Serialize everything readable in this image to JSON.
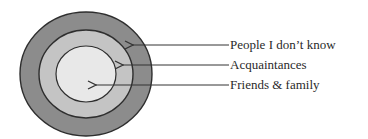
{
  "diagram": {
    "type": "concentric-circles",
    "colors": {
      "outer_ring": "#8c8c8c",
      "middle_ring": "#c4c4c4",
      "inner_circle": "#e8e8e8",
      "stroke": "#2e2e2e",
      "arrow": "#333333",
      "text": "#2a2a2a"
    },
    "rings": [
      {
        "id": "outer",
        "label": "People I don’t know"
      },
      {
        "id": "middle",
        "label": "Acquaintances"
      },
      {
        "id": "inner",
        "label": "Friends & family"
      }
    ]
  }
}
